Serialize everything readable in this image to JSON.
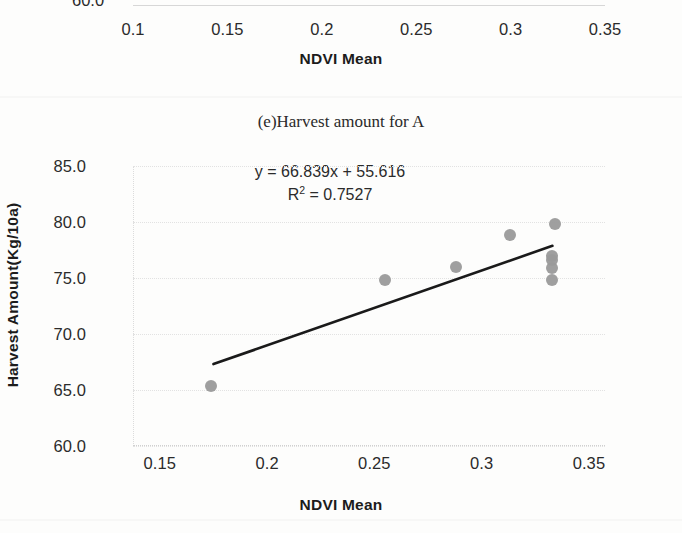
{
  "figure": {
    "background_color": "#fdfdfc",
    "point_color": "#9a9a9a",
    "trendline_color": "#1a1a1a"
  },
  "previous_chart": {
    "partial_y_tick": "60.0",
    "x_ticks": [
      "0.1",
      "0.15",
      "0.2",
      "0.25",
      "0.3",
      "0.35"
    ],
    "xlabel": "NDVI Mean"
  },
  "chart_data": {
    "type": "scatter",
    "title": "(e)Harvest amount for A",
    "xlabel": "NDVI Mean",
    "ylabel": "Harvest Amount(Kg/10a)",
    "xlim": [
      0.1375,
      0.3575
    ],
    "ylim": [
      60.0,
      85.0
    ],
    "xticks": [
      "0.15",
      "0.2",
      "0.25",
      "0.3",
      "0.35"
    ],
    "xtick_values": [
      0.15,
      0.2,
      0.25,
      0.3,
      0.35
    ],
    "yticks": [
      "60.0",
      "65.0",
      "70.0",
      "75.0",
      "80.0",
      "85.0"
    ],
    "ytick_values": [
      60.0,
      65.0,
      70.0,
      75.0,
      80.0,
      85.0
    ],
    "grid": true,
    "legend": "none",
    "annotations": {
      "equation": "y = 66.839x + 55.616",
      "r_squared_prefix": "R",
      "r_squared_exponent": "2",
      "r_squared_value": " = 0.7527"
    },
    "fit": {
      "slope": 66.839,
      "intercept": 55.616,
      "r2": 0.7527,
      "line_x_start": 0.175,
      "line_x_end": 0.333
    },
    "points": [
      {
        "x": 0.174,
        "y": 65.4
      },
      {
        "x": 0.255,
        "y": 74.8
      },
      {
        "x": 0.288,
        "y": 76.0
      },
      {
        "x": 0.313,
        "y": 78.8
      },
      {
        "x": 0.334,
        "y": 79.8
      },
      {
        "x": 0.333,
        "y": 77.0
      },
      {
        "x": 0.333,
        "y": 76.6
      },
      {
        "x": 0.333,
        "y": 75.9
      },
      {
        "x": 0.333,
        "y": 74.8
      }
    ]
  }
}
